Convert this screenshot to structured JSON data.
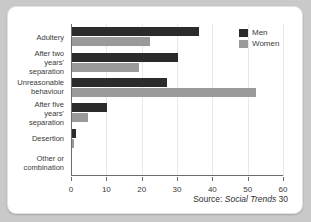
{
  "source": {
    "prefix": "Source:",
    "publication": "Social Trends",
    "issue": "30"
  },
  "legend": {
    "position": "top-right",
    "entries": [
      {
        "label": "Men",
        "color": "#2b2b2b"
      },
      {
        "label": "Women",
        "color": "#9a9a9a"
      }
    ]
  },
  "axis": {
    "ticks": [
      "0",
      "10",
      "20",
      "30",
      "40",
      "50",
      "60"
    ]
  },
  "chart_data": {
    "type": "bar",
    "orientation": "horizontal",
    "title": "",
    "subtitle": "",
    "xlabel": "",
    "ylabel": "",
    "xlim": [
      0,
      60
    ],
    "xticks": [
      0,
      10,
      20,
      30,
      40,
      50,
      60
    ],
    "grid": true,
    "legend_position": "top-right",
    "categories": [
      "Adultery",
      "After two years'\nseparation",
      "Unreasonable\nbehaviour",
      "After five years'\nseparation",
      "Desertion",
      "Other or\ncombination"
    ],
    "series": [
      {
        "name": "Men",
        "color": "#2b2b2b",
        "values": [
          36,
          30,
          27,
          10,
          1,
          0
        ]
      },
      {
        "name": "Women",
        "color": "#9a9a9a",
        "values": [
          22,
          19,
          52,
          4.5,
          0.5,
          0
        ]
      }
    ],
    "annotations": [
      "Source: Social Trends 30"
    ]
  }
}
